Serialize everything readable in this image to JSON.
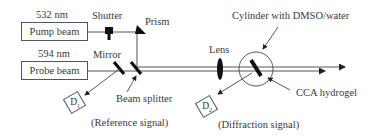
{
  "diagram": {
    "sources": {
      "pump": {
        "wavelength": "532 nm",
        "label": "Pump beam"
      },
      "probe": {
        "wavelength": "594 nm",
        "label": "Probe beam"
      }
    },
    "components": {
      "shutter": "Shutter",
      "prism": "Prism",
      "mirror": "Mirror",
      "beam_splitter": "Beam splitter",
      "lens": "Lens",
      "cylinder": "Cylinder with DMSO/water",
      "hydrogel": "CCA hydrogel"
    },
    "detectors": {
      "d1": {
        "label": "D",
        "subscript": "1",
        "signal": "(Reference signal)"
      },
      "d2": {
        "label": "D",
        "subscript": "2",
        "signal": "(Diffraction signal)"
      }
    },
    "colors": {
      "line": "#555555",
      "element": "#111111"
    }
  }
}
